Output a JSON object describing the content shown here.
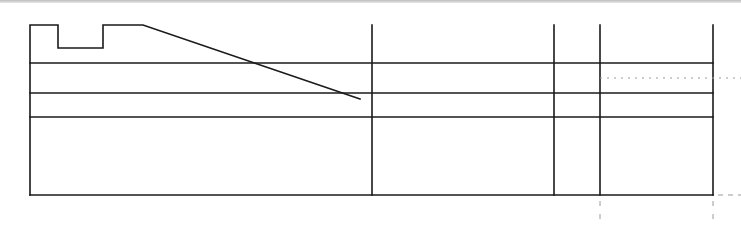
{
  "diagram": {
    "type": "technical-line-drawing",
    "stroke_color": "#1a1a1a",
    "dash_color": "#9a9a9a",
    "background": "#ffffff",
    "profile_points": "30,195 30,25 58,25 58,48 103,48 103,25 143,25 360,99",
    "frame": {
      "left": 30,
      "right": 713,
      "top": 25,
      "bottom": 195
    },
    "horizontal_lines_y": [
      63,
      93,
      117,
      195
    ],
    "vertical_lines_x": [
      372,
      554,
      600,
      713
    ],
    "dotted_line": {
      "y": 78,
      "x1": 600,
      "x2": 741
    },
    "dashed_extension": {
      "y": 195,
      "x1": 718,
      "x2": 741
    },
    "tick_marks_x": [
      600,
      713
    ]
  }
}
